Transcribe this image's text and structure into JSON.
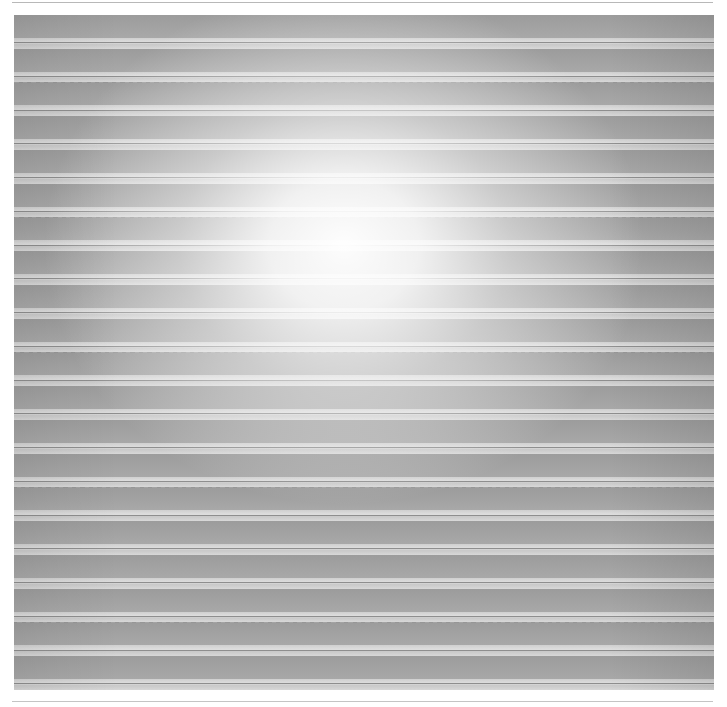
{
  "image": {
    "description": "Photograph of a grey horizontally striped textured surface with a bright central highlight",
    "stripe_count": 20,
    "colors": {
      "dark_band": "#9c9c9c",
      "light_band": "#d8d8d8",
      "highlight": "#ffffff",
      "rule_line": "#b8b8b8"
    }
  }
}
